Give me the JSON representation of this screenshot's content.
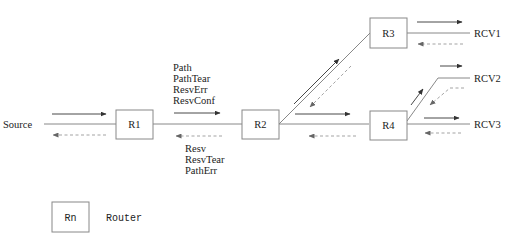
{
  "diagram": {
    "nodes": {
      "source": "Source",
      "r1": "R1",
      "r2": "R2",
      "r3": "R3",
      "r4": "R4",
      "rcv1": "RCV1",
      "rcv2": "RCV2",
      "rcv3": "RCV3"
    },
    "downstream_messages": [
      "Path",
      "PathTear",
      "ResvErr",
      "ResvConf"
    ],
    "upstream_messages": [
      "Resv",
      "ResvTear",
      "PathErr"
    ],
    "legend": {
      "symbol": "Rn",
      "label": "Router"
    },
    "colors": {
      "line": "#888888",
      "forward_arrow": "#333333",
      "reverse_arrow": "#999999",
      "text": "#222222"
    }
  }
}
